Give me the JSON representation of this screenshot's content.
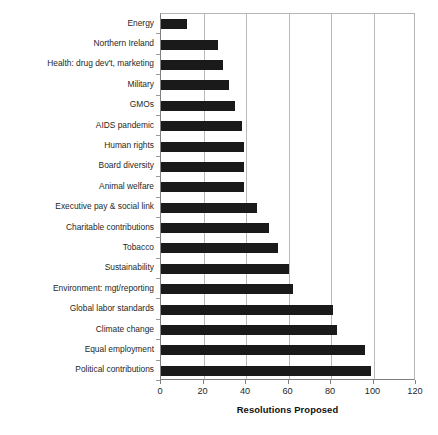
{
  "chart_data": {
    "type": "bar",
    "orientation": "horizontal",
    "title": "",
    "xlabel": "Resolutions Proposed",
    "ylabel": "",
    "xlim": [
      0,
      120
    ],
    "ylim": null,
    "grid": "vertical",
    "legend": "none",
    "xticks": [
      0,
      20,
      40,
      60,
      80,
      100,
      120
    ],
    "xtick_labels": [
      "0",
      "20",
      "40",
      "60",
      "80",
      "100",
      "120"
    ],
    "categories": [
      "Energy",
      "Northern Ireland",
      "Health: drug dev't, marketing",
      "Military",
      "GMOs",
      "AIDS pandemic",
      "Human rights",
      "Board diversity",
      "Animal welfare",
      "Executive pay & social link",
      "Charitable contributions",
      "Tobacco",
      "Sustainability",
      "Environment: mgt/reporting",
      "Global labor standards",
      "Climate change",
      "Equal employment",
      "Political contributions"
    ],
    "values": [
      12,
      27,
      29,
      32,
      35,
      38,
      39,
      39,
      39,
      45,
      51,
      55,
      60,
      62,
      81,
      83,
      96,
      99
    ],
    "bar_color": "#1a1a1a",
    "background_color": "#ffffff",
    "gridline_color": "#b9b9b9"
  }
}
